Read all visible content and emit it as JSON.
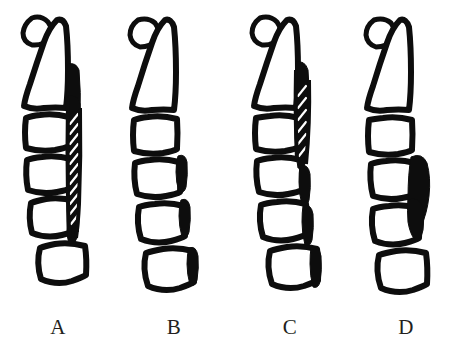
{
  "figure": {
    "background_color": "#ffffff",
    "ink_color": "#0d0d0d",
    "label_color": "#231f20",
    "panel_count": 4
  },
  "panels": [
    {
      "id": "a",
      "label": "A",
      "lesion_style": "continuous-hatched-band",
      "vertebra_count": 6,
      "has_spinous_process": true
    },
    {
      "id": "b",
      "label": "B",
      "lesion_style": "segmental-discrete-patches",
      "vertebra_count": 6,
      "has_spinous_process": true
    },
    {
      "id": "c",
      "label": "C",
      "lesion_style": "mixed-continuous-and-segmental",
      "vertebra_count": 6,
      "has_spinous_process": true
    },
    {
      "id": "d",
      "label": "D",
      "lesion_style": "localized-single-mass",
      "vertebra_count": 6,
      "has_spinous_process": true
    }
  ],
  "labels": {
    "a": "A",
    "b": "B",
    "c": "C",
    "d": "D"
  }
}
